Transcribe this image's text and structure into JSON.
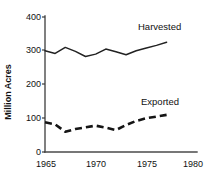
{
  "chart_data": {
    "type": "line",
    "title": "",
    "xlabel": "",
    "ylabel": "Million Acres",
    "xlim": [
      1965,
      1980
    ],
    "ylim": [
      0,
      400
    ],
    "grid": false,
    "legend_position": "inline-right",
    "x_ticks": [
      "1965",
      "1970",
      "1975",
      "1980"
    ],
    "x_tick_values": [
      1965,
      1970,
      1975,
      1980
    ],
    "y_ticks": [
      "0",
      "100",
      "200",
      "300",
      "400"
    ],
    "y_tick_values": [
      0,
      100,
      200,
      300,
      400
    ],
    "series": [
      {
        "name": "Harvested",
        "style": "solid",
        "color": "#222222",
        "x": [
          1965,
          1966,
          1967,
          1968,
          1969,
          1970,
          1971,
          1972,
          1973,
          1974,
          1975,
          1976,
          1977
        ],
        "values": [
          300,
          292,
          310,
          298,
          283,
          290,
          305,
          297,
          288,
          300,
          308,
          316,
          325
        ]
      },
      {
        "name": "Exported",
        "style": "dashed",
        "color": "#151515",
        "x": [
          1965,
          1966,
          1967,
          1968,
          1969,
          1970,
          1971,
          1972,
          1973,
          1974,
          1975,
          1976,
          1977
        ],
        "values": [
          88,
          82,
          60,
          68,
          73,
          78,
          72,
          65,
          80,
          92,
          100,
          105,
          110
        ]
      }
    ]
  },
  "labels": {
    "y_axis_title": "Million Acres",
    "series_harvested": "Harvested",
    "series_exported": "Exported"
  }
}
